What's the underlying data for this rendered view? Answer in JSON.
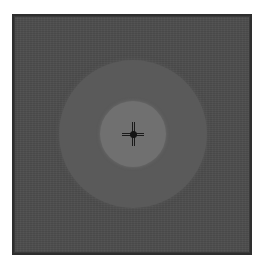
{
  "image": {
    "description": "Grayscale square image with dark frame, concentric lighter discs, and a dark crosshair at center",
    "colors": {
      "background": "#ffffff",
      "frame_border": "#2e2e2e",
      "field": "#4d4d4d",
      "outer_disc": "#5a5a5a",
      "inner_disc": "#707070",
      "crosshair": "#1a1a1a"
    },
    "elements": [
      {
        "name": "outer-disc",
        "radius_px": 74
      },
      {
        "name": "inner-disc",
        "radius_px": 33
      },
      {
        "name": "crosshair",
        "arm_length_px": 11
      }
    ]
  }
}
